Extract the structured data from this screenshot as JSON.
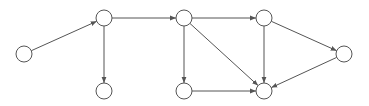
{
  "diagram": {
    "type": "directed-graph",
    "node_radius": 8,
    "colors": {
      "stroke": "#555555",
      "fill": "#ffffff",
      "background": "#ffffff"
    },
    "nodes": [
      {
        "id": "A",
        "x": 24,
        "y": 54
      },
      {
        "id": "B",
        "x": 104,
        "y": 18
      },
      {
        "id": "C",
        "x": 104,
        "y": 91
      },
      {
        "id": "D",
        "x": 184,
        "y": 18
      },
      {
        "id": "E",
        "x": 184,
        "y": 91
      },
      {
        "id": "F",
        "x": 264,
        "y": 18
      },
      {
        "id": "G",
        "x": 264,
        "y": 91
      },
      {
        "id": "H",
        "x": 344,
        "y": 54
      }
    ],
    "edges": [
      {
        "from": "A",
        "to": "B"
      },
      {
        "from": "B",
        "to": "D"
      },
      {
        "from": "B",
        "to": "C"
      },
      {
        "from": "D",
        "to": "F"
      },
      {
        "from": "D",
        "to": "E"
      },
      {
        "from": "D",
        "to": "G"
      },
      {
        "from": "F",
        "to": "G"
      },
      {
        "from": "F",
        "to": "H"
      },
      {
        "from": "E",
        "to": "G"
      },
      {
        "from": "H",
        "to": "G"
      }
    ]
  }
}
